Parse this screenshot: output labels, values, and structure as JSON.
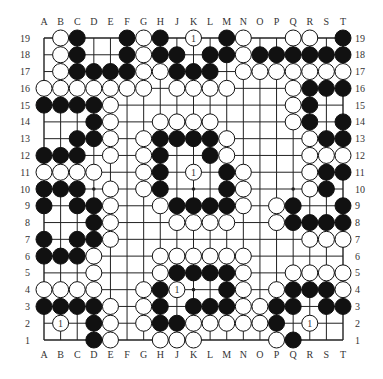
{
  "diagram": {
    "type": "go-board",
    "size": 19,
    "columns": [
      "A",
      "B",
      "C",
      "D",
      "E",
      "F",
      "G",
      "H",
      "J",
      "K",
      "L",
      "M",
      "N",
      "O",
      "P",
      "Q",
      "R",
      "S",
      "T"
    ],
    "rows": [
      "19",
      "18",
      "17",
      "16",
      "15",
      "14",
      "13",
      "12",
      "11",
      "10",
      "9",
      "8",
      "7",
      "6",
      "5",
      "4",
      "3",
      "2",
      "1"
    ],
    "legend": {
      "B": "black stone",
      "W": "white stone",
      ".": "empty"
    },
    "marker_label": "1",
    "board": [
      ".WB..BWB.W.BWO.WW.B",
      ".WB..BWBB.BBWBBBBBB",
      ".WBBBBWWBBB.WWWWWWW",
      "WWWWWWW.WWWW...WBBBB",
      "BBBBW..........WB...",
      "...BW..WWWW....WB.BB",
      "..BBW.WBBBBW....WBB.",
      "BBB.W.WB..BW....WWWW",
      "WWWW..WB.W.BW...WBBB",
      "BBB.W.WB...BW...WB..",
      "B.BBW..WBBBBW.WB..B",
      "...BW...WWWW..WBBBB",
      "B.BBW...........WWWW",
      "BBBW...WWWWWW......",
      "...W...WBBBBW..WWWW",
      "WWWW..WBW..BW.WBBBW",
      "BBBBW.WB.BBBWWBB.BB",
      ".W.BW.WBBWWWWWB.W..",
      "...BW..WWW....WB..."
    ],
    "marked_stones": [
      "K19",
      "K11",
      "J4",
      "B2",
      "R2"
    ]
  }
}
